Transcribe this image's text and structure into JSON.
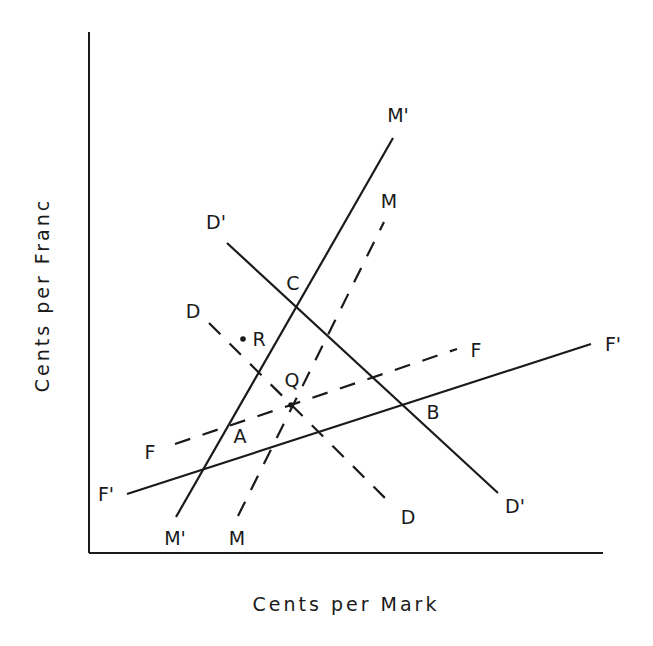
{
  "diagram": {
    "type": "economic-line-diagram",
    "axes": {
      "x_label": "Cents per Mark",
      "y_label": "Cents per Franc",
      "origin": [
        89,
        553
      ],
      "x_end": [
        603,
        553
      ],
      "y_end": [
        89,
        32
      ]
    },
    "colors": {
      "ink": "#1a1a1a",
      "background": "#ffffff"
    },
    "lines": [
      {
        "id": "M-prime",
        "style": "solid",
        "from": [
          176,
          517
        ],
        "to": [
          393,
          138
        ],
        "label_start": "M'",
        "label_end": "M'",
        "label_start_pos": [
          175,
          545
        ],
        "label_end_pos": [
          398,
          122
        ]
      },
      {
        "id": "M",
        "style": "dashed",
        "from": [
          238,
          516
        ],
        "to": [
          384,
          222
        ],
        "label_start": "M",
        "label_end": "M",
        "label_start_pos": [
          237,
          545
        ],
        "label_end_pos": [
          389,
          208
        ]
      },
      {
        "id": "D-prime",
        "style": "solid",
        "from": [
          227,
          243
        ],
        "to": [
          498,
          493
        ],
        "label_start": "D'",
        "label_end": "D'",
        "label_start_pos": [
          216,
          229
        ],
        "label_end_pos": [
          515,
          513
        ]
      },
      {
        "id": "D",
        "style": "dashed",
        "from": [
          209,
          323
        ],
        "to": [
          390,
          503
        ],
        "label_start": "D",
        "label_end": "D",
        "label_start_pos": [
          193,
          318
        ],
        "label_end_pos": [
          408,
          524
        ]
      },
      {
        "id": "F-prime",
        "style": "solid",
        "from": [
          127,
          494
        ],
        "to": [
          591,
          344
        ],
        "label_start": "F'",
        "label_end": "F'",
        "label_start_pos": [
          106,
          501
        ],
        "label_end_pos": [
          613,
          351
        ]
      },
      {
        "id": "F",
        "style": "dashed",
        "from": [
          175,
          444
        ],
        "to": [
          457,
          349
        ],
        "label_start": "F",
        "label_end": "F",
        "label_start_pos": [
          150,
          459
        ],
        "label_end_pos": [
          476,
          357
        ]
      }
    ],
    "points": [
      {
        "id": "A",
        "label": "A",
        "at": [
          230,
          427
        ],
        "label_pos": [
          240,
          443
        ],
        "marker": false
      },
      {
        "id": "B",
        "label": "B",
        "at": [
          403,
          405
        ],
        "label_pos": [
          433,
          419
        ],
        "marker": false
      },
      {
        "id": "C",
        "label": "C",
        "at": [
          297,
          308
        ],
        "label_pos": [
          293,
          290
        ],
        "marker": false
      },
      {
        "id": "Q",
        "label": "Q",
        "at": [
          291,
          405
        ],
        "label_pos": [
          292,
          387
        ],
        "marker": true
      },
      {
        "id": "R",
        "label": "R",
        "at": [
          243,
          339
        ],
        "label_pos": [
          259,
          346
        ],
        "marker": true
      }
    ]
  }
}
